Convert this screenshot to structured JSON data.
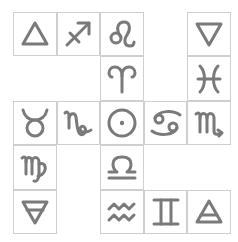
{
  "colors": {
    "glyph": "#7a7a7a",
    "border": "#cfcfcf",
    "background": "#ffffff"
  },
  "grid": {
    "columns": 5,
    "rows": 5,
    "cells": [
      {
        "row": 0,
        "col": 0,
        "symbol": "fire-triangle",
        "unicode": "🜂"
      },
      {
        "row": 0,
        "col": 1,
        "symbol": "sagittarius",
        "unicode": "♐"
      },
      {
        "row": 0,
        "col": 2,
        "symbol": "leo",
        "unicode": "♌"
      },
      {
        "row": 0,
        "col": 4,
        "symbol": "water-triangle",
        "unicode": "🜄"
      },
      {
        "row": 1,
        "col": 2,
        "symbol": "aries",
        "unicode": "♈"
      },
      {
        "row": 1,
        "col": 4,
        "symbol": "pisces",
        "unicode": "♓"
      },
      {
        "row": 2,
        "col": 0,
        "symbol": "taurus",
        "unicode": "♉"
      },
      {
        "row": 2,
        "col": 1,
        "symbol": "capricorn",
        "unicode": "♑"
      },
      {
        "row": 2,
        "col": 2,
        "symbol": "sun",
        "unicode": "☉"
      },
      {
        "row": 2,
        "col": 3,
        "symbol": "cancer",
        "unicode": "♋"
      },
      {
        "row": 2,
        "col": 4,
        "symbol": "scorpio",
        "unicode": "♏"
      },
      {
        "row": 3,
        "col": 0,
        "symbol": "virgo",
        "unicode": "♍"
      },
      {
        "row": 3,
        "col": 2,
        "symbol": "libra",
        "unicode": "♎"
      },
      {
        "row": 4,
        "col": 0,
        "symbol": "earth-triangle",
        "unicode": "🜃"
      },
      {
        "row": 4,
        "col": 2,
        "symbol": "aquarius",
        "unicode": "♒"
      },
      {
        "row": 4,
        "col": 3,
        "symbol": "gemini",
        "unicode": "♊"
      },
      {
        "row": 4,
        "col": 4,
        "symbol": "air-triangle",
        "unicode": "🜁"
      }
    ]
  }
}
